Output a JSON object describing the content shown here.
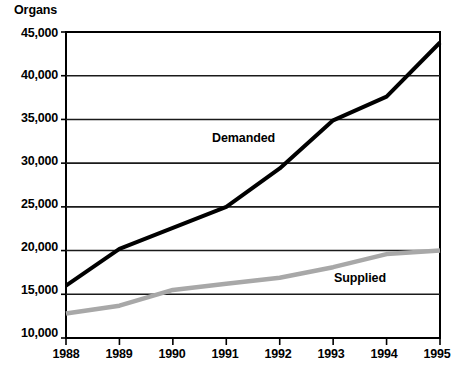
{
  "chart_data": {
    "type": "line",
    "title": "",
    "axis_note": "Organs",
    "xlabel": "",
    "ylabel": "Organs",
    "x": [
      1988,
      1989,
      1990,
      1991,
      1992,
      1993,
      1994,
      1995
    ],
    "xtick_labels": [
      "1988",
      "1989",
      "1990",
      "1991",
      "1992",
      "1993",
      "1994",
      "1995"
    ],
    "ytick_labels": [
      "45,000",
      "40,000",
      "35,000",
      "30,000",
      "25,000",
      "20,000",
      "15,000",
      "10,000"
    ],
    "ytick_values": [
      45000,
      40000,
      35000,
      30000,
      25000,
      20000,
      15000,
      10000
    ],
    "ylim": [
      10000,
      45000
    ],
    "xlim": [
      1988,
      1995
    ],
    "grid": "horizontal",
    "legend": "inline-labels",
    "series": [
      {
        "name": "Demanded",
        "color": "#000000",
        "values": [
          16000,
          20200,
          22600,
          25000,
          29400,
          34900,
          37600,
          43800
        ]
      },
      {
        "name": "Supplied",
        "color": "#a8a8a8",
        "values": [
          12800,
          13700,
          15500,
          16200,
          16900,
          18100,
          19600,
          20000
        ]
      }
    ],
    "annotations": [
      {
        "text": "Demanded",
        "x": 1992,
        "y": 31000
      },
      {
        "text": "Supplied",
        "x": 1994,
        "y": 17600
      }
    ]
  },
  "colors": {
    "demanded": "#000000",
    "supplied": "#a8a8a8",
    "axis": "#000000",
    "grid": "#1a1a1a",
    "background": "#ffffff"
  }
}
